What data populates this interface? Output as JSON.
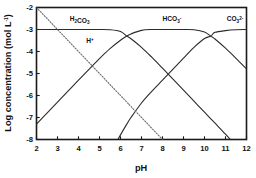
{
  "chart_data": {
    "type": "line",
    "title": "",
    "xlabel": "pH",
    "ylabel": "Log concentration (mol L",
    "ylabel_sup": "-1",
    "ylabel_tail": ")",
    "xlim": [
      2,
      12
    ],
    "ylim": [
      -8,
      -2
    ],
    "grid": false,
    "legend": "inline-labels",
    "x_ticks": [
      "2",
      "3",
      "4",
      "5",
      "6",
      "7",
      "8",
      "9",
      "10",
      "11",
      "12"
    ],
    "y_ticks": [
      "-2",
      "-3",
      "-4",
      "-5",
      "-6",
      "-7",
      "-8"
    ],
    "total_carbonate_log": -3,
    "pK1": 6.3,
    "pK2": 10.3,
    "x": [
      2,
      2.5,
      3,
      3.5,
      4,
      4.5,
      5,
      5.5,
      6,
      6.3,
      6.5,
      7,
      7.5,
      8,
      8.5,
      9,
      9.5,
      10,
      10.3,
      10.5,
      11,
      11.5,
      12
    ],
    "series": [
      {
        "name": "H2CO3",
        "label_text": "H",
        "label_sub": "2",
        "label_mid": "CO",
        "label_sub2": "3",
        "label_sup": "",
        "style": "solid",
        "label_x": 4.05,
        "label_y": -2.62,
        "values": [
          -3.0,
          -3.0,
          -3.0,
          -3.0,
          -3.0,
          -3.0,
          -3.0,
          -3.01,
          -3.09,
          -3.3,
          -3.42,
          -3.81,
          -4.27,
          -4.76,
          -5.26,
          -5.76,
          -6.26,
          -6.76,
          -7.06,
          -7.26,
          -7.76,
          -8.3,
          -8.9
        ]
      },
      {
        "name": "HCO3-",
        "label_text": "HCO",
        "label_sub": "3",
        "label_sup": "-",
        "style": "solid",
        "label_x": 8.45,
        "label_y": -2.62,
        "values": [
          -7.3,
          -6.8,
          -6.3,
          -5.8,
          -5.3,
          -4.81,
          -4.32,
          -3.87,
          -3.49,
          -3.3,
          -3.2,
          -3.04,
          -3.0,
          -3.0,
          -3.0,
          -3.0,
          -3.01,
          -3.11,
          -3.3,
          -3.43,
          -3.85,
          -4.31,
          -4.79
        ]
      },
      {
        "name": "CO3 2-",
        "label_text": "CO",
        "label_sub": "3",
        "label_sup": "2-",
        "style": "solid",
        "label_x": 11.45,
        "label_y": -2.62,
        "values": [
          -15.6,
          -14.6,
          -13.6,
          -12.6,
          -11.6,
          -10.61,
          -9.62,
          -8.67,
          -7.79,
          -7.3,
          -7.0,
          -6.34,
          -5.8,
          -5.3,
          -4.8,
          -4.3,
          -3.81,
          -3.41,
          -3.3,
          -3.13,
          -3.05,
          -3.01,
          -3.0
        ]
      },
      {
        "name": "H+",
        "label_text": "H",
        "label_sub": "",
        "label_sup": "+",
        "style": "dotted",
        "label_x": 4.55,
        "label_y": -3.62,
        "values": [
          -2,
          -2.5,
          -3,
          -3.5,
          -4,
          -4.5,
          -5,
          -5.5,
          -6,
          -6.3,
          -6.5,
          -7,
          -7.5,
          -8,
          -8.5,
          -9,
          -9.5,
          -10,
          -10.3,
          -10.5,
          -11,
          -11.5,
          -12
        ]
      }
    ]
  }
}
